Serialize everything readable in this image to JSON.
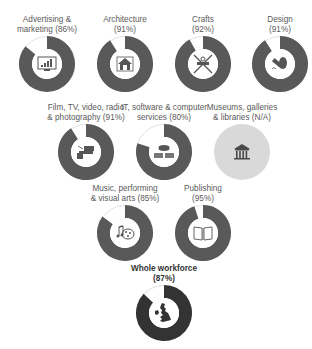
{
  "colors": {
    "filled": "#595959",
    "remainder": "#ffffff",
    "ring_outline": "#e2e2e2",
    "na_fill": "#d9d9d9",
    "whole_filled": "#333333",
    "icon": "#555555"
  },
  "chart_data": {
    "type": "pie",
    "title": "",
    "subtype": "donut",
    "categories": [
      "Advertising & marketing",
      "Architecture",
      "Crafts",
      "Design",
      "Film, TV, video, radio & photography",
      "IT, software & computer services",
      "Museums, galleries & libraries",
      "Music, performing & visual arts",
      "Publishing",
      "Whole workforce"
    ],
    "values": [
      86,
      91,
      92,
      91,
      91,
      80,
      null,
      85,
      95,
      87
    ],
    "unit": "%"
  },
  "charts": [
    {
      "id": "advertising",
      "line1": "Advertising &",
      "line2": "marketing (86%)",
      "value": 86,
      "icon": "chart-monitor-icon",
      "cx": 47,
      "cy": 64,
      "bold": false
    },
    {
      "id": "architecture",
      "line1": "Architecture",
      "line2": "(91%)",
      "value": 91,
      "icon": "house-icon",
      "cx": 125,
      "cy": 64,
      "bold": false
    },
    {
      "id": "crafts",
      "line1": "Crafts",
      "line2": "(92%)",
      "value": 92,
      "icon": "tools-icon",
      "cx": 203,
      "cy": 64,
      "bold": false
    },
    {
      "id": "design",
      "line1": "Design",
      "line2": "(91%)",
      "value": 91,
      "icon": "pen-mouse-icon",
      "cx": 280,
      "cy": 64,
      "bold": false
    },
    {
      "id": "film",
      "line1": "Film, TV, video, radio",
      "line2": "& photography (91%)",
      "value": 91,
      "icon": "camera-icon",
      "cx": 86,
      "cy": 152,
      "bold": false
    },
    {
      "id": "it",
      "line1": "IT, software & computer",
      "line2": "services (80%)",
      "value": 80,
      "icon": "cloud-server-icon",
      "cx": 164,
      "cy": 152,
      "bold": false
    },
    {
      "id": "museums",
      "line1": "Museums, galleries",
      "line2": "& libraries (N/A)",
      "value": null,
      "icon": "museum-icon",
      "cx": 242,
      "cy": 152,
      "bold": false
    },
    {
      "id": "music",
      "line1": "Music, performing",
      "line2": "& visual arts (85%)",
      "value": 85,
      "icon": "music-palette-icon",
      "cx": 125,
      "cy": 233,
      "bold": false
    },
    {
      "id": "publishing",
      "line1": "Publishing",
      "line2": "(95%)",
      "value": 95,
      "icon": "book-icon",
      "cx": 203,
      "cy": 233,
      "bold": false
    },
    {
      "id": "whole",
      "line1": "Whole workforce",
      "line2": "(87%)",
      "value": 87,
      "icon": "uk-map-icon",
      "cx": 164,
      "cy": 313,
      "bold": true
    }
  ]
}
